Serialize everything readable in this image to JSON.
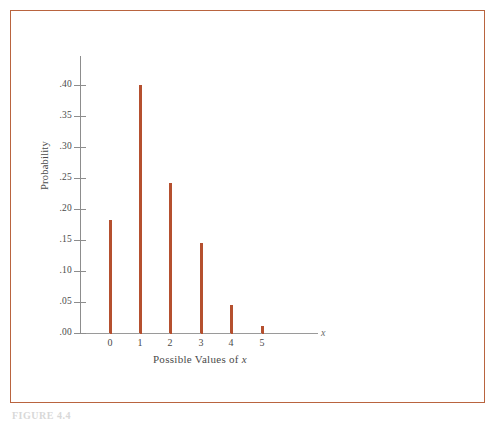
{
  "figure": {
    "caption": "FIGURE 4.4",
    "frame_color": "#b9643f",
    "background": "#ffffff"
  },
  "chart_data": {
    "type": "bar",
    "title": "",
    "subtitle": "",
    "xlabel": "Possible Values of x",
    "xlabel_variable": "x",
    "ylabel": "Probability",
    "categories": [
      "0",
      "1",
      "2",
      "3",
      "4",
      "5"
    ],
    "values": [
      0.182,
      0.4,
      0.242,
      0.145,
      0.045,
      0.011
    ],
    "x": [
      0,
      1,
      2,
      3,
      4,
      5
    ],
    "xlim": [
      -0.45,
      7.5
    ],
    "ylim": [
      0.0,
      0.44
    ],
    "ytick_labels": [
      ".00",
      ".05",
      ".10",
      ".15",
      ".20",
      ".25",
      ".30",
      ".35",
      ".40"
    ],
    "ytick_values": [
      0.0,
      0.05,
      0.1,
      0.15,
      0.2,
      0.25,
      0.3,
      0.35,
      0.4
    ],
    "xtick_labels": [
      "0",
      "1",
      "2",
      "3",
      "4",
      "5"
    ],
    "grid": false,
    "legend": null,
    "legend_position": "none",
    "bar_color": "#b5502f",
    "axis_color": "#8d8d8d",
    "style": "spike-plot"
  }
}
